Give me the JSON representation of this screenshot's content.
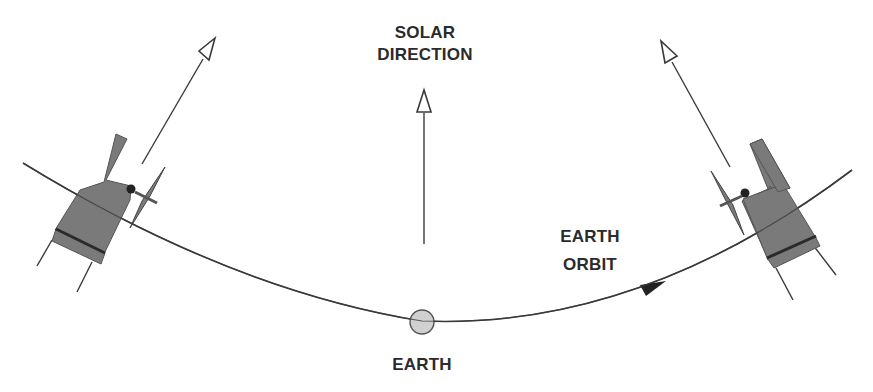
{
  "labels": {
    "solar_direction": [
      "SOLAR",
      "DIRECTION"
    ],
    "earth_orbit": [
      "EARTH",
      "ORBIT"
    ],
    "earth": "EARTH"
  },
  "colors": {
    "background": "#ffffff",
    "line": "#3a3a3a",
    "spacecraft_body": "#7a7a7a",
    "spacecraft_band": "#2a2a2a",
    "earth_fill": "#d0d0d0",
    "text": "#2b2b2b"
  },
  "elements": {
    "orbit": "curved arc from left spacecraft through Earth to right spacecraft, with direction arrow pointing right",
    "solar_arrow": "vertical open-headed arrow pointing up toward solar direction",
    "spacecraft_left": "spacecraft with sunshade and antenna dish, pointing arrow toward upper right",
    "spacecraft_right": "spacecraft with sunshade and antenna dish, pointing arrow toward upper left"
  }
}
